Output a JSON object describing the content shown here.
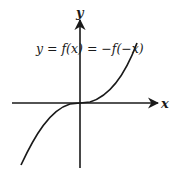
{
  "diagram": {
    "equation": "y = f(x) = −f(−x)",
    "x_axis_label": "x",
    "y_axis_label": "y",
    "curve": "odd function through origin, increasing, flat at origin (cubic-like)",
    "colors": {
      "stroke": "#1a1a1a",
      "background": "#ffffff"
    }
  }
}
